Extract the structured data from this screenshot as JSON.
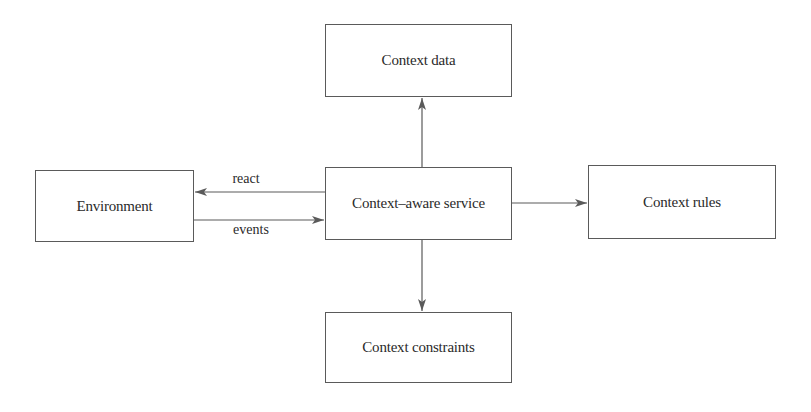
{
  "diagram": {
    "nodes": {
      "context_data": {
        "label": "Context data"
      },
      "environment": {
        "label": "Environment"
      },
      "service": {
        "label": "Context–aware service"
      },
      "context_rules": {
        "label": "Context rules"
      },
      "context_constraints": {
        "label": "Context constraints"
      }
    },
    "edges": [
      {
        "from": "service",
        "to": "context_data",
        "label": ""
      },
      {
        "from": "service",
        "to": "environment",
        "label": "react"
      },
      {
        "from": "environment",
        "to": "service",
        "label": "events"
      },
      {
        "from": "service",
        "to": "context_rules",
        "label": ""
      },
      {
        "from": "service",
        "to": "context_constraints",
        "label": ""
      }
    ],
    "edge_labels": {
      "react": "react",
      "events": "events"
    },
    "colors": {
      "stroke": "#5a5a5a",
      "text": "#2a2a2a",
      "background": "#ffffff"
    }
  }
}
